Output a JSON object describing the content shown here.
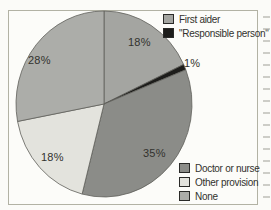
{
  "chart_data": {
    "type": "pie",
    "title": "",
    "start_angle_deg": 0,
    "direction": "clockwise",
    "slices": [
      {
        "label": "First aider",
        "value": 18,
        "pct_label": "18%",
        "color": "#a4a5a1"
      },
      {
        "label": "\"Responsible person\"",
        "value": 1,
        "pct_label": "1%",
        "color": "#1d1d1b"
      },
      {
        "label": "Doctor or nurse",
        "value": 35,
        "pct_label": "35%",
        "color": "#8b8c88"
      },
      {
        "label": "Other provision",
        "value": 18,
        "pct_label": "18%",
        "color": "#e3e3dd"
      },
      {
        "label": "None",
        "value": 28,
        "pct_label": "28%",
        "color": "#acada9"
      }
    ],
    "legend_positions": {
      "top_right": [
        "First aider",
        "\"Responsible person\""
      ],
      "bottom_right": [
        "Doctor or nurse",
        "Other provision",
        "None"
      ]
    },
    "outline_color": "#5f5f5b",
    "frame_border_color": "#b2b2a4"
  }
}
